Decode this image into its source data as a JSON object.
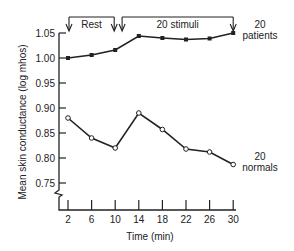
{
  "chart_data": {
    "type": "line",
    "title": "",
    "xlabel": "Time  (min)",
    "ylabel": "Mean skin conductance  (log  mhos)",
    "x": [
      2,
      6,
      10,
      14,
      18,
      22,
      26,
      30
    ],
    "x_ticks": [
      "2",
      "6",
      "10",
      "14",
      "18",
      "22",
      "26",
      "30"
    ],
    "y_ticks": [
      "1.05",
      "1.00",
      "0.95",
      "0.90",
      "0.85",
      "0.80",
      "0.75"
    ],
    "y_tick_values": [
      1.05,
      1.0,
      0.95,
      0.9,
      0.85,
      0.8,
      0.75
    ],
    "ylim": [
      0.72,
      1.06
    ],
    "xlim": [
      0,
      30
    ],
    "y_axis_break": true,
    "grid": false,
    "series": [
      {
        "name": "20 patients",
        "label_lines": [
          "20",
          "patients"
        ],
        "marker": "filled-square",
        "values": [
          1.0,
          1.006,
          1.016,
          1.044,
          1.04,
          1.037,
          1.039,
          1.05
        ]
      },
      {
        "name": "20 normals",
        "label_lines": [
          "20",
          "normals"
        ],
        "marker": "open-circle",
        "values": [
          0.88,
          0.84,
          0.82,
          0.89,
          0.857,
          0.818,
          0.812,
          0.787
        ]
      }
    ],
    "annotations": [
      {
        "text": "Rest",
        "from": 2,
        "to": 10
      },
      {
        "text": "20  stimuli",
        "from": 11,
        "to": 30
      }
    ]
  }
}
